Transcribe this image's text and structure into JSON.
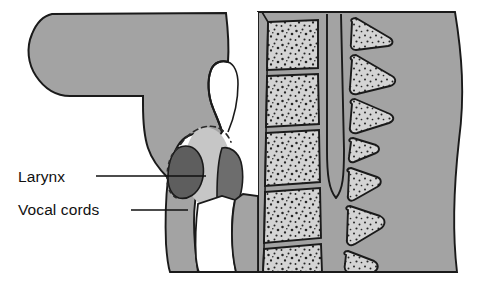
{
  "figure": {
    "type": "anatomical-illustration",
    "view": "midsagittal section of head and neck",
    "background_color": "#ffffff",
    "width": 497,
    "height": 287
  },
  "palette": {
    "soft_tissue_gray": "#a3a3a3",
    "soft_tissue_gray_light": "#b0b0b0",
    "bone_light_gray": "#d4d4d4",
    "vestibule_gray": "#c6c6c6",
    "vocal_cord_dark": "#5e5e5e",
    "arytenoid_dark": "#6d6d6d",
    "airway_white": "#ffffff",
    "outline_black": "#1a1a1a",
    "speckle_black": "#222222",
    "label_text": "#111111"
  },
  "labels": [
    {
      "id": "larynx",
      "text": "Larynx",
      "x": 18,
      "y": 182,
      "leader": {
        "x1": 96,
        "y1": 176,
        "x2": 206,
        "y2": 176
      }
    },
    {
      "id": "vocal-cords",
      "text": "Vocal cords",
      "x": 18,
      "y": 215,
      "leader": {
        "x1": 131,
        "y1": 210,
        "x2": 188,
        "y2": 210
      }
    }
  ],
  "structures": [
    {
      "id": "tongue-oral-soft-tissue",
      "name": "Tongue and oral soft tissue",
      "tone": "#a3a3a3"
    },
    {
      "id": "epiglottis",
      "name": "Epiglottis",
      "tone": "#a3a3a3"
    },
    {
      "id": "laryngeal-vestibule",
      "name": "Laryngeal vestibule",
      "tone": "#c6c6c6"
    },
    {
      "id": "vocal-cord-anterior",
      "name": "Anterior vocal cord",
      "tone": "#5e5e5e"
    },
    {
      "id": "arytenoid-posterior",
      "name": "Posterior arytenoid region",
      "tone": "#6d6d6d"
    },
    {
      "id": "trachea-airway",
      "name": "Tracheal airway",
      "tone": "#ffffff"
    },
    {
      "id": "vertebral-bodies",
      "name": "Cervical vertebral bodies",
      "tone": "#d4d4d4",
      "count": 5
    },
    {
      "id": "spinal-canal",
      "name": "Spinal canal",
      "tone": "#a3a3a3"
    },
    {
      "id": "spinous-processes",
      "name": "Spinous processes",
      "tone": "#d4d4d4",
      "count": 7
    },
    {
      "id": "posterior-neck-tissue",
      "name": "Posterior neck soft tissue",
      "tone": "#a3a3a3"
    }
  ]
}
